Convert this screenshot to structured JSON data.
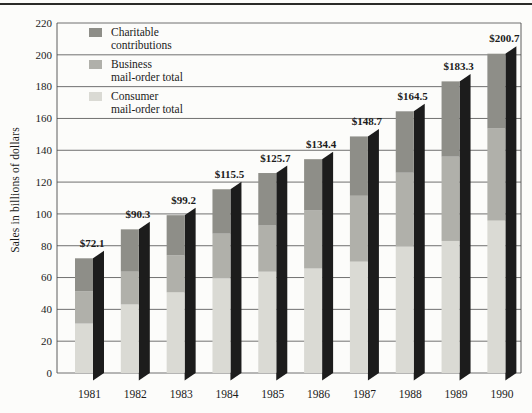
{
  "chart_data": {
    "type": "bar",
    "subtype": "stacked-3d",
    "title": "",
    "ylabel": "Sales in billions of dollars",
    "ylim": [
      0,
      220
    ],
    "ytick_step": 20,
    "grid": true,
    "legend_position": "top-left-inside",
    "categories": [
      "1981",
      "1982",
      "1983",
      "1984",
      "1985",
      "1986",
      "1987",
      "1988",
      "1989",
      "1990"
    ],
    "series": [
      {
        "name": "Consumer mail-order total",
        "color": "#dadad4",
        "values": [
          31.1,
          43.1,
          50.7,
          59.5,
          63.7,
          65.7,
          70.0,
          79.5,
          83.0,
          95.8
        ]
      },
      {
        "name": "Business mail-order total",
        "color": "#b0b0aa",
        "values": [
          20.2,
          20.6,
          23.3,
          28.1,
          29.0,
          36.7,
          41.4,
          46.4,
          53.0,
          57.9
        ]
      },
      {
        "name": "Charitable contributions",
        "color": "#8e8e88",
        "values": [
          20.8,
          26.6,
          25.2,
          27.9,
          33.0,
          32.0,
          37.3,
          38.6,
          47.3,
          47.0
        ]
      }
    ],
    "totals": [
      72.1,
      90.3,
      99.2,
      115.5,
      125.7,
      134.4,
      148.7,
      164.5,
      183.3,
      200.7
    ],
    "total_labels": [
      "$72.1",
      "$90.3",
      "$99.2",
      "$115.5",
      "$125.7",
      "$134.4",
      "$148.7",
      "$164.5",
      "$183.3",
      "$200.7"
    ],
    "legend": [
      {
        "line1": "Charitable",
        "line2": "contributions",
        "series_index": 2
      },
      {
        "line1": "Business",
        "line2": "mail-order total",
        "series_index": 1
      },
      {
        "line1": "Consumer",
        "line2": "mail-order total",
        "series_index": 0
      }
    ],
    "colors": {
      "side_shadow": "#1c1c1c",
      "gridline": "#4c4c4c",
      "frame": "#4c4c4c",
      "text": "#1b1b1b",
      "top_rule": "#2b2b28",
      "background": "#fcfcfa"
    }
  }
}
